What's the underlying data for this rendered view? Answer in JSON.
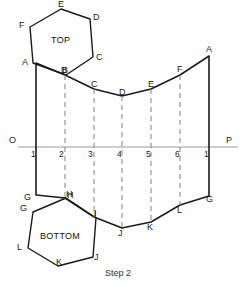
{
  "figure": {
    "caption": "Step 2",
    "face_labels": {
      "top": "TOP",
      "bottom": "BOTTOM"
    },
    "axis": {
      "left_label": "O",
      "right_label": "P",
      "y": 147,
      "x_start": 18,
      "x_end": 238,
      "color": "#9a9a9a"
    },
    "station_numbers": [
      "1",
      "2",
      "3",
      "4",
      "5",
      "6",
      "1"
    ],
    "station_x": [
      36,
      65,
      94,
      122,
      151,
      180,
      209
    ],
    "colors": {
      "outline": "#1a1a1a",
      "dashed": "#8c8c8c",
      "axis": "#9a9a9a",
      "text": "#1a1a1a",
      "background": "#ffffff"
    },
    "top_view_hexagon": {
      "name": "TOP",
      "vertices": [
        {
          "label": "A",
          "x": 33,
          "y": 63
        },
        {
          "label": "F",
          "x": 30,
          "y": 27
        },
        {
          "label": "E",
          "x": 61,
          "y": 9
        },
        {
          "label": "D",
          "x": 90,
          "y": 19
        },
        {
          "label": "C",
          "x": 93,
          "y": 57
        },
        {
          "label": "B",
          "x": 66,
          "y": 75
        }
      ],
      "label_positions": [
        {
          "label": "A",
          "x": 22,
          "y": 58
        },
        {
          "label": "F",
          "x": 19,
          "y": 21
        },
        {
          "label": "E",
          "x": 58,
          "y": 0
        },
        {
          "label": "D",
          "x": 93,
          "y": 13
        },
        {
          "label": "C",
          "x": 96,
          "y": 53
        },
        {
          "label": "B",
          "x": 61,
          "y": 66
        },
        {
          "label": "TOP",
          "x": 51,
          "y": 36
        }
      ]
    },
    "bottom_view_hexagon": {
      "name": "BOTTOM",
      "vertices": [
        {
          "label": "H",
          "x": 66,
          "y": 198
        },
        {
          "label": "G",
          "x": 33,
          "y": 212
        },
        {
          "label": "L",
          "x": 28,
          "y": 248
        },
        {
          "label": "K",
          "x": 58,
          "y": 266
        },
        {
          "label": "J",
          "x": 93,
          "y": 257
        },
        {
          "label": "I",
          "x": 96,
          "y": 218
        }
      ],
      "label_positions": [
        {
          "label": "H",
          "x": 67,
          "y": 193
        },
        {
          "label": "G",
          "x": 21,
          "y": 205
        },
        {
          "label": "L",
          "x": 18,
          "y": 244
        },
        {
          "label": "K",
          "x": 56,
          "y": 258
        },
        {
          "label": "J",
          "x": 94,
          "y": 253
        },
        {
          "label": "I",
          "x": 94,
          "y": 212
        },
        {
          "label": "BOTTOM",
          "x": 41,
          "y": 234
        }
      ]
    },
    "development_top_edge": {
      "points": [
        {
          "label": "A",
          "x": 36,
          "y": 63
        },
        {
          "label": "B",
          "x": 65,
          "y": 75
        },
        {
          "label": "C",
          "x": 94,
          "y": 89
        },
        {
          "label": "D",
          "x": 122,
          "y": 96
        },
        {
          "label": "E",
          "x": 151,
          "y": 89
        },
        {
          "label": "F",
          "x": 180,
          "y": 75
        },
        {
          "label": "A",
          "x": 209,
          "y": 56
        }
      ],
      "label_positions": [
        {
          "label": "B",
          "x": 62,
          "y": 66
        },
        {
          "label": "C",
          "x": 91,
          "y": 80
        },
        {
          "label": "D",
          "x": 119,
          "y": 88
        },
        {
          "label": "E",
          "x": 148,
          "y": 80
        },
        {
          "label": "F",
          "x": 177,
          "y": 65
        },
        {
          "label": "A",
          "x": 206,
          "y": 46
        }
      ]
    },
    "development_bottom_edge": {
      "points": [
        {
          "label": "G",
          "x": 36,
          "y": 195
        },
        {
          "label": "H",
          "x": 65,
          "y": 198
        },
        {
          "label": "I",
          "x": 94,
          "y": 217
        },
        {
          "label": "J",
          "x": 122,
          "y": 228
        },
        {
          "label": "K",
          "x": 151,
          "y": 222
        },
        {
          "label": "L",
          "x": 180,
          "y": 205
        },
        {
          "label": "G",
          "x": 209,
          "y": 196
        }
      ],
      "label_positions": [
        {
          "label": "G",
          "x": 25,
          "y": 198
        },
        {
          "label": "H",
          "x": 66,
          "y": 193
        },
        {
          "label": "I",
          "x": 94,
          "y": 212
        },
        {
          "label": "J",
          "x": 119,
          "y": 229
        },
        {
          "label": "K",
          "x": 148,
          "y": 223
        },
        {
          "label": "L",
          "x": 177,
          "y": 206
        },
        {
          "label": "G",
          "x": 206,
          "y": 197
        }
      ]
    },
    "solid_verticals": [
      {
        "x": 36,
        "y1": 63,
        "y2": 195
      },
      {
        "x": 209,
        "y1": 56,
        "y2": 196
      }
    ],
    "dashed_verticals": [
      {
        "x": 65,
        "y1": 75,
        "y2": 198
      },
      {
        "x": 94,
        "y1": 89,
        "y2": 217
      },
      {
        "x": 122,
        "y1": 96,
        "y2": 228
      },
      {
        "x": 151,
        "y1": 89,
        "y2": 222
      },
      {
        "x": 180,
        "y1": 75,
        "y2": 205
      }
    ],
    "caption_position": {
      "x": 105,
      "y": 270
    }
  }
}
